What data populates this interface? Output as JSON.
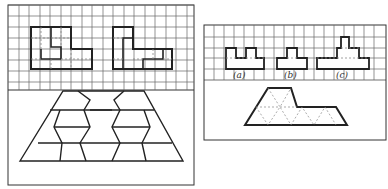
{
  "figure": {
    "left_panel": {
      "grid": {
        "x": 8,
        "y": 5,
        "cols": 18,
        "rows": 8,
        "cell": 10.5
      },
      "shapes": [
        {
          "name": "polyomino-1",
          "outline": [
            [
              3,
              3
            ],
            [
              5,
              3
            ],
            [
              5,
              5
            ],
            [
              7,
              5
            ],
            [
              7,
              7
            ],
            [
              3,
              7
            ]
          ],
          "note": "tiled cross-shaped polyomino"
        },
        {
          "name": "polyomino-2",
          "outline": [
            [
              11,
              3
            ],
            [
              13,
              3
            ],
            [
              13,
              5
            ],
            [
              16,
              5
            ],
            [
              16,
              7
            ],
            [
              11,
              7
            ]
          ],
          "note": "L-shaped polyomino"
        }
      ],
      "trapezoid": {
        "description": "trapezoid tiled with hexagon-like parallelogram pieces"
      }
    },
    "right_panel": {
      "labels": [
        "(a)",
        "(b)",
        "(c)"
      ],
      "tile_description": "polyiamond shape tiled by triangles"
    },
    "colors": {
      "line": "#222222",
      "grid": "#555555",
      "dashed": "#888888",
      "background": "#ffffff"
    }
  }
}
